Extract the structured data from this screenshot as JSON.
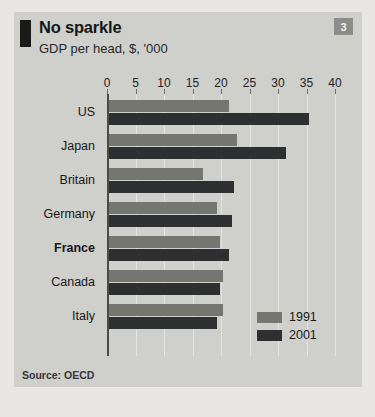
{
  "header": {
    "title": "No sparkle",
    "subtitle": "GDP per head, $, '000",
    "badge": "3"
  },
  "source": "Source: OECD",
  "colors": {
    "panel_background": "#cfcfcb",
    "page_background": "#e8e7e3",
    "series_1991": "#767671",
    "series_2001": "#2d2f31",
    "gridline": "#e3e3df",
    "axis": "#4a4a46",
    "badge_background": "#8d8d88",
    "text": "#16181a"
  },
  "chart_data": {
    "type": "bar",
    "orientation": "horizontal",
    "title": "No sparkle",
    "subtitle": "GDP per head, $, '000",
    "xlabel": "",
    "ylabel": "",
    "xlim": [
      0,
      40
    ],
    "xticks": [
      0,
      5,
      10,
      15,
      20,
      25,
      30,
      35,
      40
    ],
    "xtick_labels": [
      "0",
      "5",
      "10",
      "15",
      "20",
      "25",
      "30",
      "35",
      "40"
    ],
    "grid": true,
    "legend_position": "bottom-right",
    "categories": [
      "US",
      "Japan",
      "Britain",
      "Germany",
      "France",
      "Canada",
      "Italy"
    ],
    "highlighted_category": "France",
    "series": [
      {
        "name": "1991",
        "color": "#767671",
        "values": [
          21,
          22.5,
          16.5,
          19,
          19.5,
          20,
          20
        ]
      },
      {
        "name": "2001",
        "color": "#2d2f31",
        "values": [
          35,
          31,
          22,
          21.5,
          21,
          19.5,
          19
        ]
      }
    ]
  }
}
